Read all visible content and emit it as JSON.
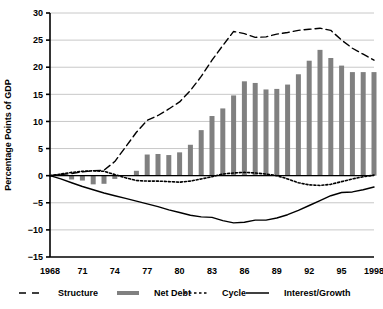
{
  "chart_data": {
    "type": "bar",
    "title": "",
    "subtitle": "",
    "xlabel": "",
    "ylabel": "Percentage Points of GDP",
    "ylim": [
      -15,
      30
    ],
    "yticks": [
      -15,
      -10,
      -5,
      0,
      5,
      10,
      15,
      20,
      25,
      30
    ],
    "ytick_labels": [
      "−15",
      "−10",
      "−5",
      "0",
      "5",
      "10",
      "15",
      "20",
      "25",
      "30"
    ],
    "xlim": [
      1968,
      1998
    ],
    "xticks": [
      1968,
      1971,
      1974,
      1977,
      1980,
      1983,
      1986,
      1989,
      1992,
      1995,
      1998
    ],
    "xtick_labels": [
      "1968",
      "71",
      "74",
      "77",
      "80",
      "83",
      "86",
      "89",
      "92",
      "95",
      "1998"
    ],
    "grid": "horizontal",
    "legend_position": "below",
    "x": [
      1968,
      1969,
      1970,
      1971,
      1972,
      1973,
      1974,
      1975,
      1976,
      1977,
      1978,
      1979,
      1980,
      1981,
      1982,
      1983,
      1984,
      1985,
      1986,
      1987,
      1988,
      1989,
      1990,
      1991,
      1992,
      1993,
      1994,
      1995,
      1996,
      1997,
      1998
    ],
    "series": [
      {
        "name": "Net Debt",
        "type": "bar",
        "color": "#808080",
        "values": [
          0.1,
          0.1,
          -0.7,
          -0.9,
          -1.6,
          -1.5,
          -0.6,
          0.1,
          0.9,
          3.9,
          4.0,
          3.8,
          4.3,
          5.7,
          8.4,
          11.0,
          12.4,
          14.8,
          17.4,
          17.1,
          15.9,
          16.0,
          16.8,
          18.7,
          21.2,
          23.2,
          21.7,
          20.3,
          19.1,
          19.1,
          19.1
        ]
      },
      {
        "name": "Structure",
        "type": "line",
        "style": "long-dash",
        "color": "#000000",
        "values": [
          0.0,
          0.2,
          0.4,
          0.7,
          0.9,
          1.0,
          2.6,
          5.3,
          8.0,
          10.2,
          11.1,
          12.3,
          13.6,
          15.7,
          18.3,
          21.3,
          24.0,
          26.6,
          26.2,
          25.5,
          25.6,
          26.1,
          26.4,
          26.8,
          27.0,
          27.2,
          26.8,
          25.0,
          23.5,
          22.4,
          21.3
        ]
      },
      {
        "name": "Cycle",
        "type": "line",
        "style": "dotted",
        "color": "#000000",
        "values": [
          0.0,
          0.3,
          0.6,
          0.8,
          0.9,
          0.8,
          0.2,
          -0.4,
          -0.9,
          -1.0,
          -1.0,
          -1.1,
          -1.2,
          -1.0,
          -0.6,
          -0.2,
          0.3,
          0.5,
          0.6,
          0.5,
          0.3,
          0.0,
          -0.6,
          -1.3,
          -1.7,
          -1.8,
          -1.6,
          -1.1,
          -0.6,
          -0.2,
          0.1
        ]
      },
      {
        "name": "Interest/Growth",
        "type": "line",
        "style": "solid",
        "color": "#000000",
        "values": [
          0.0,
          -0.6,
          -1.3,
          -2.0,
          -2.6,
          -3.2,
          -3.7,
          -4.2,
          -4.7,
          -5.2,
          -5.7,
          -6.3,
          -6.8,
          -7.3,
          -7.6,
          -7.7,
          -8.3,
          -8.7,
          -8.6,
          -8.2,
          -8.2,
          -7.8,
          -7.2,
          -6.4,
          -5.5,
          -4.6,
          -3.7,
          -3.1,
          -3.0,
          -2.6,
          -2.1
        ]
      }
    ]
  },
  "legend": {
    "items": [
      {
        "label": "Structure",
        "marker": "long-dash-line"
      },
      {
        "label": "Net Debt",
        "marker": "thick-gray-bar"
      },
      {
        "label": "Cycle",
        "marker": "dotted-line"
      },
      {
        "label": "Interest/Growth",
        "marker": "solid-line"
      }
    ]
  },
  "colors": {
    "bar": "#808080",
    "line": "#000000",
    "grid": "#c8c8c8",
    "axis": "#000000",
    "background": "#ffffff"
  }
}
